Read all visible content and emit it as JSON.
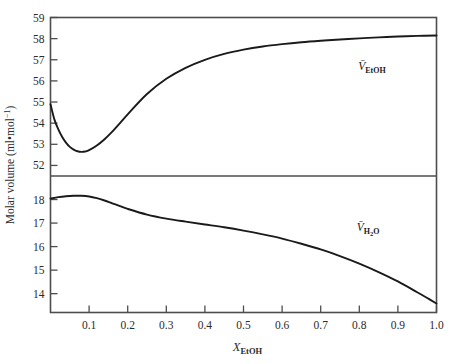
{
  "chart_data": {
    "type": "line",
    "title": "",
    "xlabel": "X_EtOH",
    "xlabel_base": "X",
    "xlabel_sub": "EtOH",
    "ylabel": "Molar volume (ml•mol⁻¹)",
    "ylabel_base": "Molar volume (ml•mol",
    "ylabel_sup": "−1",
    "ylabel_tail": ")",
    "xlim": [
      0.0,
      1.0
    ],
    "grid": false,
    "legend_position": "inline-annotation",
    "panels": [
      {
        "name": "upper",
        "ylim": [
          51.5,
          59.0
        ],
        "yticks": [
          52,
          53,
          54,
          55,
          56,
          57,
          58,
          59
        ],
        "ytick_labels": [
          "52",
          "53",
          "54",
          "55",
          "56",
          "57",
          "58",
          "59"
        ],
        "series": [
          {
            "name": "V_EtOH",
            "annotation_base": "V",
            "annotation_sub": "EtOH",
            "x": [
              0.0,
              0.01,
              0.02,
              0.03,
              0.04,
              0.05,
              0.06,
              0.07,
              0.08,
              0.09,
              0.1,
              0.12,
              0.14,
              0.16,
              0.18,
              0.2,
              0.25,
              0.3,
              0.35,
              0.4,
              0.45,
              0.5,
              0.55,
              0.6,
              0.65,
              0.7,
              0.75,
              0.8,
              0.85,
              0.9,
              0.95,
              1.0
            ],
            "y": [
              54.9,
              54.18,
              53.72,
              53.36,
              53.08,
              52.88,
              52.75,
              52.67,
              52.64,
              52.66,
              52.72,
              52.94,
              53.24,
              53.6,
              54.0,
              54.42,
              55.38,
              56.1,
              56.62,
              57.0,
              57.28,
              57.48,
              57.63,
              57.74,
              57.83,
              57.9,
              57.96,
              58.01,
              58.06,
              58.1,
              58.13,
              58.15
            ]
          }
        ]
      },
      {
        "name": "lower",
        "ylim": [
          13.2,
          19.0
        ],
        "yticks": [
          14,
          15,
          16,
          17,
          18
        ],
        "ytick_labels": [
          "14",
          "15",
          "16",
          "17",
          "18"
        ],
        "untick_values": [
          13,
          19
        ],
        "series": [
          {
            "name": "V_H2O",
            "annotation_base": "V",
            "annotation_sub": "H",
            "annotation_sub_num": "2",
            "annotation_sub_tail": "O",
            "x": [
              0.0,
              0.02,
              0.04,
              0.06,
              0.08,
              0.1,
              0.12,
              0.14,
              0.16,
              0.18,
              0.2,
              0.25,
              0.3,
              0.35,
              0.4,
              0.45,
              0.5,
              0.55,
              0.6,
              0.65,
              0.7,
              0.75,
              0.8,
              0.85,
              0.9,
              0.95,
              0.98,
              1.0
            ],
            "y": [
              18.04,
              18.1,
              18.14,
              18.16,
              18.16,
              18.13,
              18.06,
              17.96,
              17.84,
              17.72,
              17.6,
              17.36,
              17.19,
              17.06,
              16.94,
              16.82,
              16.68,
              16.52,
              16.34,
              16.12,
              15.88,
              15.6,
              15.28,
              14.92,
              14.52,
              14.06,
              13.78,
              13.58
            ]
          }
        ]
      }
    ],
    "xticks": [
      0.1,
      0.2,
      0.3,
      0.4,
      0.5,
      0.6,
      0.7,
      0.8,
      0.9,
      1.0
    ],
    "xtick_labels": [
      "0.1",
      "0.2",
      "0.3",
      "0.4",
      "0.5",
      "0.6",
      "0.7",
      "0.8",
      "0.9",
      "1.0"
    ],
    "colors": {
      "curve": "#1a1a1a",
      "axis": "#4d4d4d",
      "text": "#2b2b2b",
      "background": "#ffffff"
    }
  }
}
